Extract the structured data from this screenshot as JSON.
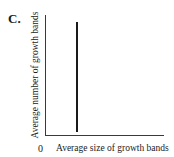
{
  "panel": {
    "label": "C."
  },
  "chart_data": {
    "type": "line",
    "title": "",
    "panel_label": "C.",
    "xlabel": "Average size of growth bands",
    "ylabel": "Average number of growth bands",
    "origin_tick": "0",
    "grid": false,
    "legend": null,
    "series": [
      {
        "name": "relationship",
        "description": "vertical line: constant size of growth bands regardless of number of growth bands",
        "x": [
          0.27,
          0.27
        ],
        "y": [
          0.06,
          0.95
        ]
      }
    ],
    "xlim": [
      0,
      1
    ],
    "ylim": [
      0,
      1
    ],
    "colors": {
      "axis": "#3a3a3a",
      "line": "#1a1a1a",
      "background": "#ffffff"
    }
  }
}
